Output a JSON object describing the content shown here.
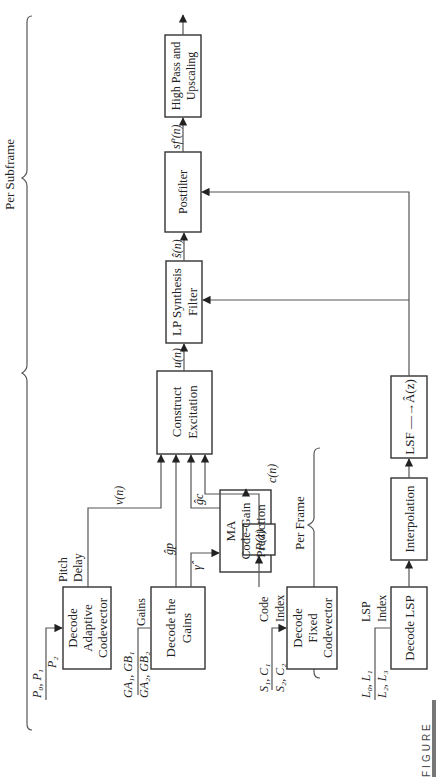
{
  "figure": {
    "caption_tag": "FIGURE",
    "orientation": "rotated 90° counterclockwise"
  },
  "groups": {
    "per_subframe": "Per Subframe",
    "per_frame": "Per Frame"
  },
  "blocks": {
    "decode_adaptive": [
      "Decode",
      "Adaptive",
      "Codevector"
    ],
    "decode_gains": [
      "Decode the",
      "Gains"
    ],
    "decode_fixed": [
      "Decode",
      "Fixed",
      "Codevector"
    ],
    "ma_prediction": [
      "MA",
      "Code-Gain",
      "Prediction"
    ],
    "pz": "P(z)",
    "construct_excitation": [
      "Construct",
      "Excitation"
    ],
    "lp_synthesis": [
      "LP Synthesis",
      "Filter"
    ],
    "postfilter": "Postfilter",
    "highpass": [
      "High Pass and",
      "Upscaling"
    ],
    "decode_lsp": "Decode LSP",
    "interpolation": "Interpolation",
    "lsf_to_az": "LSF —→Â(z)"
  },
  "inputs": {
    "pitch": {
      "top": "P₀, P₁",
      "bottom": "P₂",
      "label": [
        "Pitch",
        "Delay"
      ]
    },
    "gains": {
      "top": "GA₁, GB₁",
      "bottom": "GA₂, GB₂",
      "label": "Gains"
    },
    "code": {
      "top": "S₁, C₁",
      "bottom": "S₂, C₂",
      "label": [
        "Code",
        "Index"
      ]
    },
    "lsp": {
      "top": "L₀, L₁",
      "bottom": "L₂, L₃",
      "label": [
        "LSP",
        "Index"
      ]
    }
  },
  "signals": {
    "vn": "v(n)",
    "gp": "ĝp",
    "gc": "ĝc",
    "gamma": "γ̂",
    "cn": "c(n)",
    "un": "u(n)",
    "sn": "ŝ(n)",
    "sfn": "sf′(n)"
  }
}
